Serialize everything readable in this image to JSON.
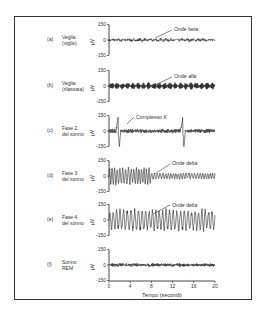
{
  "chart_data": {
    "type": "line",
    "title": "",
    "xlabel": "Tempo (secondi)",
    "ylabel": "μV",
    "xlim": [
      0,
      20
    ],
    "ylim": [
      -150,
      150
    ],
    "x_ticks": [
      "0",
      "4",
      "8",
      "12",
      "16",
      "20"
    ],
    "y_ticks": [
      "150",
      "0",
      "-150"
    ],
    "grid": false,
    "panels": [
      {
        "id": "a",
        "letter": "(a)",
        "line1": "Veglia",
        "line2": "(vigile)",
        "annotation": "Onde beta",
        "wave": "beta",
        "amplitude_uv": 15,
        "frequency_hz": 20
      },
      {
        "id": "b",
        "letter": "(b)",
        "line1": "Veglia",
        "line2": "(rilassata)",
        "annotation": "Onde alfa",
        "wave": "alpha",
        "amplitude_uv": 30,
        "frequency_hz": 10
      },
      {
        "id": "c",
        "letter": "(c)",
        "line1": "Fase 2",
        "line2": "del sonno",
        "annotation": "Complesso K",
        "wave": "stage2",
        "amplitude_uv": 20,
        "frequency_hz": 6,
        "events_s": [
          1.6,
          13.8
        ]
      },
      {
        "id": "d",
        "letter": "(d)",
        "line1": "Fase 3",
        "line2": "del sonno",
        "annotation": "Onde delta",
        "wave": "delta-mixed",
        "amplitude_uv": 70,
        "frequency_hz": 2
      },
      {
        "id": "e",
        "letter": "(e)",
        "line1": "Fase 4",
        "line2": "del sonno",
        "annotation": "Onde delta",
        "wave": "delta",
        "amplitude_uv": 110,
        "frequency_hz": 1.5
      },
      {
        "id": "f",
        "letter": "(f)",
        "line1": "Sonno",
        "line2": "REM",
        "annotation": "",
        "wave": "rem",
        "amplitude_uv": 18,
        "frequency_hz": 8
      }
    ]
  },
  "colors": {
    "ink": "#333333",
    "trace": "#2a2a2a",
    "background": "#ffffff"
  }
}
